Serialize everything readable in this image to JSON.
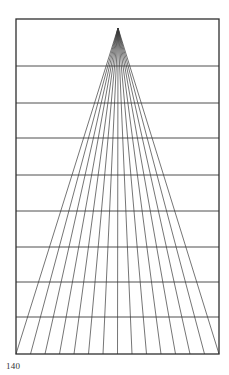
{
  "page": {
    "number": "140"
  },
  "diagram": {
    "type": "perspective-fan-grid",
    "frame": {
      "x1": 16,
      "y1": 19,
      "x2": 219,
      "y2": 354
    },
    "apex": {
      "x": 118,
      "y": 28
    },
    "fan_line_count": 15,
    "horizontal_lines_y": [
      66,
      103,
      138,
      175,
      211,
      247,
      282,
      317
    ],
    "colors": {
      "line": "#3a3a3a",
      "frame": "#2e2e2e",
      "background": "#ffffff"
    }
  }
}
